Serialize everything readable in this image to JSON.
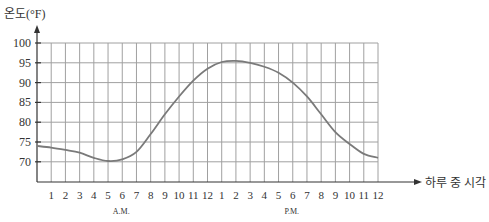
{
  "chart_data": {
    "type": "line",
    "title": "",
    "ylabel": "온도(°F)",
    "xlabel": "하루 중 시각",
    "ylim": [
      65,
      100
    ],
    "xlim": [
      0,
      24
    ],
    "grid": true,
    "legend": null,
    "y_ticks": [
      70,
      75,
      80,
      85,
      90,
      95,
      100
    ],
    "y_tick_labels": [
      "70",
      "75",
      "80",
      "85",
      "90",
      "95",
      "100"
    ],
    "x_tick_labels": [
      "1",
      "2",
      "3",
      "4",
      "5",
      "6",
      "7",
      "8",
      "9",
      "10",
      "11",
      "12",
      "1",
      "2",
      "3",
      "4",
      "5",
      "6",
      "7",
      "8",
      "9",
      "10",
      "11",
      "12"
    ],
    "period_labels": [
      {
        "text": "A.M.",
        "at_hour": 6
      },
      {
        "text": "P.M.",
        "at_hour": 18
      }
    ],
    "series": [
      {
        "name": "temperature",
        "x": [
          0,
          1,
          2,
          3,
          4,
          5,
          6,
          7,
          8,
          9,
          10,
          11,
          12,
          13,
          14,
          15,
          16,
          17,
          18,
          19,
          20,
          21,
          22,
          23,
          24
        ],
        "values": [
          74,
          73.6,
          73,
          72.3,
          71,
          70.2,
          70.6,
          72.5,
          77,
          82,
          86.5,
          90.5,
          93.5,
          95.2,
          95.5,
          95,
          94,
          92.5,
          90,
          86.5,
          82,
          77.5,
          74.5,
          72,
          71
        ]
      }
    ],
    "colors": {
      "curve": "#7a7a7a",
      "grid": "#a0a0a0",
      "axis": "#333333"
    }
  }
}
